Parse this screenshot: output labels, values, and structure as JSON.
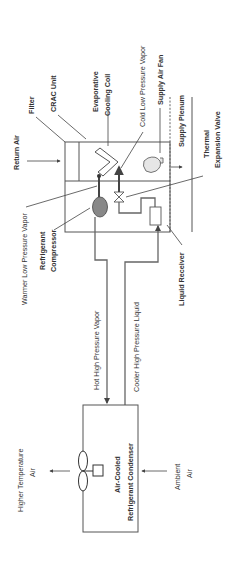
{
  "diagram": {
    "orientation": "rotated-90-ccw",
    "colors": {
      "line": "#555555",
      "compressor_fill": "#888888",
      "fan_fill": "#e6e6e6",
      "background": "#ffffff"
    },
    "crac_unit": {
      "title": "CRAC Unit",
      "labels": {
        "return_air": "Return Air",
        "filter": "Filter",
        "evaporative_coil_line1": "Evaporative",
        "evaporative_coil_line2": "Cooling Coil",
        "cold_low_pressure_vapor": "Cold Low Pressure Vapor",
        "supply_air_fan": "Supply Air Fan",
        "supply_plenum": "Supply Plenum",
        "thermal_expansion_valve_line1": "Thermal",
        "thermal_expansion_valve_line2": "Expansion Valve",
        "warmer_low_pressure_vapor": "Warmer Low Pressure Vapor",
        "refrigerant_compressor_line1": "Refrigerant",
        "refrigerant_compressor_line2": "Compressor",
        "liquid_receiver": "Liquid Receiver"
      }
    },
    "piping": {
      "hot_high_pressure_vapor": "Hot High Pressure Vapor",
      "cooler_high_pressure_liquid": "Cooler High Pressure Liquid"
    },
    "condenser": {
      "title_line1": "Air-Cooled",
      "title_line2": "Refrigerant Condenser",
      "labels": {
        "higher_temp_air_line1": "Higher Temperature",
        "higher_temp_air_line2": "Air",
        "ambient_air_line1": "Ambient",
        "ambient_air_line2": "Air"
      }
    }
  }
}
